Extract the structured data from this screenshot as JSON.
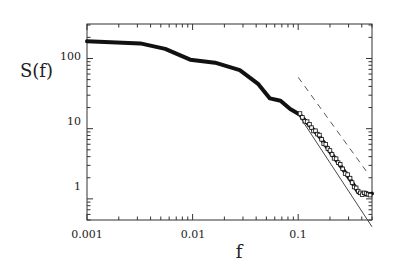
{
  "chart_data": {
    "type": "scatter",
    "title": "",
    "xlabel": "f",
    "ylabel": "S(f)",
    "xscale": "log",
    "yscale": "log",
    "xlim": [
      0.001,
      0.5
    ],
    "ylim": [
      0.5,
      310
    ],
    "grid": false,
    "legend": null,
    "x_tick_labels": [
      "0.001",
      "0.01",
      "0.1"
    ],
    "x_ticks": [
      0.001,
      0.01,
      0.1
    ],
    "y_tick_labels": [
      "1",
      "10",
      "100"
    ],
    "y_ticks": [
      1,
      10,
      100
    ],
    "series": [
      {
        "name": "data",
        "style": "dense markers (open squares at high f)",
        "x": [
          0.001,
          0.0032,
          0.0055,
          0.0095,
          0.0163,
          0.028,
          0.042,
          0.054,
          0.068,
          0.084,
          0.104,
          0.128,
          0.159,
          0.2,
          0.25,
          0.31,
          0.37,
          0.44,
          0.5
        ],
        "y": [
          176,
          164,
          137,
          96,
          87,
          68,
          43,
          27,
          25,
          19,
          15.8,
          11.1,
          7.8,
          4.7,
          3.0,
          1.9,
          1.24,
          1.15,
          1.19
        ]
      },
      {
        "name": "fit (solid)",
        "style": "solid line",
        "x": [
          0.1,
          0.5
        ],
        "y": [
          16,
          0.4
        ]
      },
      {
        "name": "power law (dashed)",
        "style": "dashed line",
        "x": [
          0.1,
          0.44
        ],
        "y": [
          54,
          2.5
        ]
      }
    ]
  },
  "labels": {
    "xlabel": "f",
    "ylabel": "S(f)",
    "x_ticks": [
      "0.001",
      "0.01",
      "0.1"
    ],
    "y_ticks": [
      "1",
      "10",
      "100"
    ]
  }
}
